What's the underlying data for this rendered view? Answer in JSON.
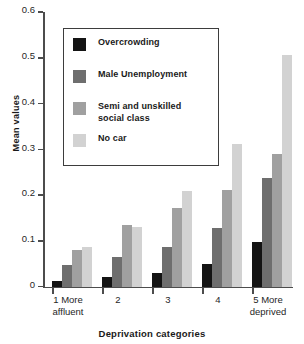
{
  "chart_data": {
    "type": "bar",
    "title": "",
    "xlabel": "Deprivation categories",
    "ylabel": "Mean values",
    "ylim": [
      0,
      0.6
    ],
    "ytick_labels": [
      "0.6",
      "0.5",
      "0.4",
      "0.3",
      "0.2",
      "0.1",
      "0"
    ],
    "ytick_values": [
      0.6,
      0.5,
      0.4,
      0.3,
      0.2,
      0.1,
      0
    ],
    "grid": false,
    "legend_position": "upper-left-inset",
    "categories": [
      "1 More affluent",
      "2",
      "3",
      "4",
      "5 More deprived"
    ],
    "category_labels": [
      {
        "line1": "1  More",
        "line2": "affluent"
      },
      {
        "line1": "2",
        "line2": ""
      },
      {
        "line1": "3",
        "line2": ""
      },
      {
        "line1": "4",
        "line2": ""
      },
      {
        "line1": "5  More",
        "line2": "deprived"
      }
    ],
    "series": [
      {
        "name": "Overcrowding",
        "color": "#141414",
        "values": [
          0.012,
          0.02,
          0.03,
          0.05,
          0.098
        ]
      },
      {
        "name": "Male Unemployment",
        "color": "#6e6e6e",
        "values": [
          0.048,
          0.064,
          0.086,
          0.127,
          0.238
        ]
      },
      {
        "name": "Semi and unskilled\nsocial class",
        "color": "#a0a0a0",
        "values": [
          0.079,
          0.135,
          0.171,
          0.212,
          0.29
        ]
      },
      {
        "name": "No car",
        "color": "#d2d2d2",
        "values": [
          0.087,
          0.131,
          0.209,
          0.311,
          0.505
        ]
      }
    ]
  },
  "legend": {
    "items": [
      {
        "label": "Overcrowding",
        "color": "#141414"
      },
      {
        "label": "Male Unemployment",
        "color": "#6e6e6e"
      },
      {
        "label": "Semi and unskilled\nsocial class",
        "color": "#a0a0a0"
      },
      {
        "label": "No car",
        "color": "#d2d2d2"
      }
    ]
  }
}
